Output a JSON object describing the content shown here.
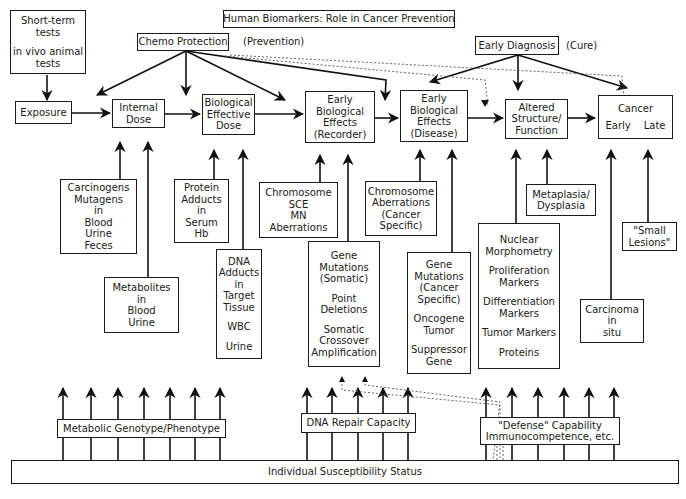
{
  "title": "Human Biomarkers: Role in Cancer Prevention",
  "top_left_box": {
    "lines": [
      "Short-term",
      "tests",
      "",
      "in vivo animal",
      "tests"
    ]
  },
  "interventions": {
    "chemo_protection": {
      "label": "Chemo Protection",
      "note": "(Prevention)"
    },
    "early_diagnosis": {
      "label": "Early Diagnosis",
      "note": "(Cure)"
    }
  },
  "stages": [
    {
      "id": "exposure",
      "lines": [
        "Exposure"
      ]
    },
    {
      "id": "internal-dose",
      "lines": [
        "Internal",
        "Dose"
      ]
    },
    {
      "id": "biological-effective-dose",
      "lines": [
        "Biological",
        "Effective",
        "Dose"
      ]
    },
    {
      "id": "early-effects-recorder",
      "lines": [
        "Early",
        "Biological",
        "Effects",
        "(Recorder)"
      ]
    },
    {
      "id": "early-effects-disease",
      "lines": [
        "Early",
        "Biological",
        "Effects",
        "(Disease)"
      ]
    },
    {
      "id": "altered-structure",
      "lines": [
        "Altered",
        "Structure/",
        "Function"
      ]
    },
    {
      "id": "cancer",
      "title": "Cancer",
      "early": "Early",
      "late": "Late"
    }
  ],
  "markers": {
    "carcinogens": [
      "Carcinogens",
      "Mutagens",
      "in",
      "Blood",
      "Urine",
      "Feces"
    ],
    "metabolites": [
      "Metabolites",
      "in",
      "Blood",
      "Urine"
    ],
    "protein_adducts": [
      "Protein",
      "Adducts",
      "in",
      "Serum",
      "Hb"
    ],
    "dna_adducts": [
      "DNA",
      "Adducts",
      "in",
      "Target",
      "Tissue",
      "",
      "WBC",
      "",
      "Urine"
    ],
    "chromosome_sce": [
      "Chromosome",
      "SCE",
      "MN",
      "Aberrations"
    ],
    "gene_mutations_somatic": [
      "Gene",
      "Mutations",
      "(Somatic)",
      "",
      "Point",
      "Deletions",
      "",
      "Somatic",
      "Crossover",
      "Amplification"
    ],
    "chromosome_aberrations_cancer": [
      "Chromosome",
      "Aberrations",
      "(Cancer",
      "Specific)"
    ],
    "gene_mutations_cancer": [
      "Gene",
      "Mutations",
      "(Cancer",
      "Specific)",
      "",
      "Oncogene",
      "Tumor",
      "",
      "Suppressor",
      "Gene"
    ],
    "metaplasia": [
      "Metaplasia/",
      "Dysplasia"
    ],
    "nuclear_morphometry": [
      "Nuclear",
      "Morphometry",
      "",
      "Proliferation",
      "Markers",
      "",
      "Differentiation",
      "Markers",
      "",
      "Tumor Markers",
      "",
      "Proteins"
    ],
    "carcinoma_in_situ": [
      "Carcinoma",
      "in",
      "situ"
    ],
    "small_lesions": [
      "\"Small",
      "Lesions\""
    ]
  },
  "susceptibility": {
    "metabolic": "Metabolic Genotype/Phenotype",
    "dna_repair": "DNA Repair Capacity",
    "defense_line1": "\"Defense\" Capability",
    "defense_line2": "Immunocompetence, etc.",
    "base": "Individual Susceptibility Status"
  }
}
